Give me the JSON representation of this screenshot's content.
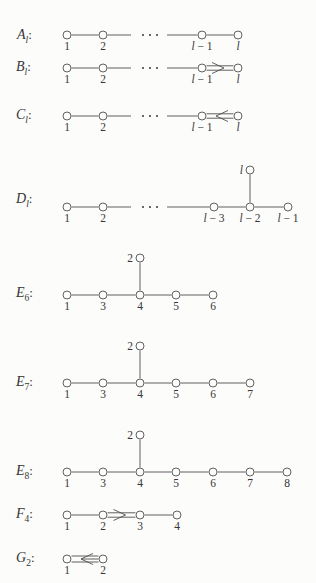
{
  "figure": {
    "colors": {
      "background": "#fcfcfb",
      "ink": "#4f4f4f",
      "text": "#363636"
    },
    "dots_text": "· · ·"
  },
  "diagrams": [
    {
      "id": "Al",
      "label": {
        "base": "A",
        "sub": "l",
        "suffix": ":"
      },
      "label_pos": [
        17,
        39
      ],
      "nodes": [
        {
          "x": 67,
          "y": 35,
          "label": "1"
        },
        {
          "x": 103,
          "y": 35,
          "label": "2"
        },
        {
          "x": 202,
          "y": 35,
          "label": "l − 1"
        },
        {
          "x": 238,
          "y": 35,
          "label": "l"
        }
      ],
      "edges": [
        {
          "from": 0,
          "to": 1,
          "mult": 1,
          "arrow": "none"
        },
        {
          "from": 2,
          "to": 3,
          "mult": 1,
          "arrow": "none"
        }
      ],
      "segments": [
        {
          "x1": 107.5,
          "y1": 35,
          "x2": 131,
          "y2": 35
        },
        {
          "x1": 167,
          "y1": 35,
          "x2": 197.5,
          "y2": 35
        }
      ],
      "dots": {
        "x": 150,
        "y": 35
      }
    },
    {
      "id": "Bl",
      "label": {
        "base": "B",
        "sub": "l",
        "suffix": ":"
      },
      "label_pos": [
        16,
        71
      ],
      "nodes": [
        {
          "x": 67,
          "y": 68,
          "label": "1"
        },
        {
          "x": 103,
          "y": 68,
          "label": "2"
        },
        {
          "x": 202,
          "y": 68,
          "label": "l − 1"
        },
        {
          "x": 238,
          "y": 68,
          "label": "l"
        }
      ],
      "edges": [
        {
          "from": 0,
          "to": 1,
          "mult": 1,
          "arrow": "none"
        },
        {
          "from": 2,
          "to": 3,
          "mult": 2,
          "arrow": "right"
        }
      ],
      "segments": [
        {
          "x1": 107.5,
          "y1": 68,
          "x2": 131,
          "y2": 68
        },
        {
          "x1": 167,
          "y1": 68,
          "x2": 197.5,
          "y2": 68
        }
      ],
      "dots": {
        "x": 150,
        "y": 68
      }
    },
    {
      "id": "Cl",
      "label": {
        "base": "C",
        "sub": "l",
        "suffix": ":"
      },
      "label_pos": [
        16,
        119
      ],
      "nodes": [
        {
          "x": 67,
          "y": 116,
          "label": "1"
        },
        {
          "x": 103,
          "y": 116,
          "label": "2"
        },
        {
          "x": 202,
          "y": 116,
          "label": "l − 1"
        },
        {
          "x": 238,
          "y": 116,
          "label": "l"
        }
      ],
      "edges": [
        {
          "from": 0,
          "to": 1,
          "mult": 1,
          "arrow": "none"
        },
        {
          "from": 2,
          "to": 3,
          "mult": 2,
          "arrow": "left"
        }
      ],
      "segments": [
        {
          "x1": 107.5,
          "y1": 116,
          "x2": 131,
          "y2": 116
        },
        {
          "x1": 167,
          "y1": 116,
          "x2": 197.5,
          "y2": 116
        }
      ],
      "dots": {
        "x": 150,
        "y": 116
      }
    },
    {
      "id": "Dl",
      "label": {
        "base": "D",
        "sub": "l",
        "suffix": ":"
      },
      "label_pos": [
        16,
        203
      ],
      "nodes": [
        {
          "x": 67,
          "y": 207,
          "label": "1"
        },
        {
          "x": 103,
          "y": 207,
          "label": "2"
        },
        {
          "x": 214,
          "y": 207,
          "label": "l − 3"
        },
        {
          "x": 250,
          "y": 207,
          "label": "l − 2"
        },
        {
          "x": 288,
          "y": 207,
          "label": "l − 1"
        },
        {
          "x": 250,
          "y": 170,
          "label": "l",
          "label_pos": "left"
        }
      ],
      "edges": [
        {
          "from": 0,
          "to": 1,
          "mult": 1,
          "arrow": "none"
        },
        {
          "from": 2,
          "to": 3,
          "mult": 1,
          "arrow": "none"
        },
        {
          "from": 3,
          "to": 4,
          "mult": 1,
          "arrow": "none"
        },
        {
          "from": 3,
          "to": 5,
          "mult": 1,
          "arrow": "none"
        }
      ],
      "segments": [
        {
          "x1": 107.5,
          "y1": 207,
          "x2": 131,
          "y2": 207
        },
        {
          "x1": 167,
          "y1": 207,
          "x2": 209.5,
          "y2": 207
        }
      ],
      "dots": {
        "x": 150,
        "y": 207
      }
    },
    {
      "id": "E6",
      "label": {
        "base": "E",
        "sub": "6",
        "suffix": ":"
      },
      "label_pos": [
        16,
        297
      ],
      "nodes": [
        {
          "x": 67,
          "y": 295,
          "label": "1"
        },
        {
          "x": 103,
          "y": 295,
          "label": "3"
        },
        {
          "x": 140,
          "y": 295,
          "label": "4"
        },
        {
          "x": 176,
          "y": 295,
          "label": "5"
        },
        {
          "x": 213,
          "y": 295,
          "label": "6"
        },
        {
          "x": 140,
          "y": 258,
          "label": "2",
          "label_pos": "left"
        }
      ],
      "edges": [
        {
          "from": 0,
          "to": 1,
          "mult": 1,
          "arrow": "none"
        },
        {
          "from": 1,
          "to": 2,
          "mult": 1,
          "arrow": "none"
        },
        {
          "from": 2,
          "to": 3,
          "mult": 1,
          "arrow": "none"
        },
        {
          "from": 3,
          "to": 4,
          "mult": 1,
          "arrow": "none"
        },
        {
          "from": 2,
          "to": 5,
          "mult": 1,
          "arrow": "none"
        }
      ],
      "segments": [],
      "dots": null
    },
    {
      "id": "E7",
      "label": {
        "base": "E",
        "sub": "7",
        "suffix": ":"
      },
      "label_pos": [
        16,
        386
      ],
      "nodes": [
        {
          "x": 67,
          "y": 383,
          "label": "1"
        },
        {
          "x": 103,
          "y": 383,
          "label": "3"
        },
        {
          "x": 140,
          "y": 383,
          "label": "4"
        },
        {
          "x": 176,
          "y": 383,
          "label": "5"
        },
        {
          "x": 213,
          "y": 383,
          "label": "6"
        },
        {
          "x": 250,
          "y": 383,
          "label": "7"
        },
        {
          "x": 140,
          "y": 346,
          "label": "2",
          "label_pos": "left"
        }
      ],
      "edges": [
        {
          "from": 0,
          "to": 1,
          "mult": 1,
          "arrow": "none"
        },
        {
          "from": 1,
          "to": 2,
          "mult": 1,
          "arrow": "none"
        },
        {
          "from": 2,
          "to": 3,
          "mult": 1,
          "arrow": "none"
        },
        {
          "from": 3,
          "to": 4,
          "mult": 1,
          "arrow": "none"
        },
        {
          "from": 4,
          "to": 5,
          "mult": 1,
          "arrow": "none"
        },
        {
          "from": 2,
          "to": 6,
          "mult": 1,
          "arrow": "none"
        }
      ],
      "segments": [],
      "dots": null
    },
    {
      "id": "E8",
      "label": {
        "base": "E",
        "sub": "8",
        "suffix": ":"
      },
      "label_pos": [
        16,
        475
      ],
      "nodes": [
        {
          "x": 67,
          "y": 472,
          "label": "1"
        },
        {
          "x": 103,
          "y": 472,
          "label": "3"
        },
        {
          "x": 140,
          "y": 472,
          "label": "4"
        },
        {
          "x": 176,
          "y": 472,
          "label": "5"
        },
        {
          "x": 213,
          "y": 472,
          "label": "6"
        },
        {
          "x": 250,
          "y": 472,
          "label": "7"
        },
        {
          "x": 287,
          "y": 472,
          "label": "8"
        },
        {
          "x": 140,
          "y": 435,
          "label": "2",
          "label_pos": "left"
        }
      ],
      "edges": [
        {
          "from": 0,
          "to": 1,
          "mult": 1,
          "arrow": "none"
        },
        {
          "from": 1,
          "to": 2,
          "mult": 1,
          "arrow": "none"
        },
        {
          "from": 2,
          "to": 3,
          "mult": 1,
          "arrow": "none"
        },
        {
          "from": 3,
          "to": 4,
          "mult": 1,
          "arrow": "none"
        },
        {
          "from": 4,
          "to": 5,
          "mult": 1,
          "arrow": "none"
        },
        {
          "from": 5,
          "to": 6,
          "mult": 1,
          "arrow": "none"
        },
        {
          "from": 2,
          "to": 7,
          "mult": 1,
          "arrow": "none"
        }
      ],
      "segments": [],
      "dots": null
    },
    {
      "id": "F4",
      "label": {
        "base": "F",
        "sub": "4",
        "suffix": ":"
      },
      "label_pos": [
        16,
        518
      ],
      "nodes": [
        {
          "x": 67,
          "y": 515,
          "label": "1"
        },
        {
          "x": 103,
          "y": 515,
          "label": "2"
        },
        {
          "x": 140,
          "y": 515,
          "label": "3"
        },
        {
          "x": 177,
          "y": 515,
          "label": "4"
        }
      ],
      "edges": [
        {
          "from": 0,
          "to": 1,
          "mult": 1,
          "arrow": "none"
        },
        {
          "from": 1,
          "to": 2,
          "mult": 2,
          "arrow": "right"
        },
        {
          "from": 2,
          "to": 3,
          "mult": 1,
          "arrow": "none"
        }
      ],
      "segments": [],
      "dots": null
    },
    {
      "id": "G2",
      "label": {
        "base": "G",
        "sub": "2",
        "suffix": ":"
      },
      "label_pos": [
        16,
        562
      ],
      "nodes": [
        {
          "x": 67,
          "y": 559,
          "label": "1"
        },
        {
          "x": 103,
          "y": 559,
          "label": "2"
        }
      ],
      "edges": [
        {
          "from": 0,
          "to": 1,
          "mult": 3,
          "arrow": "left"
        }
      ],
      "segments": [],
      "dots": null
    }
  ]
}
